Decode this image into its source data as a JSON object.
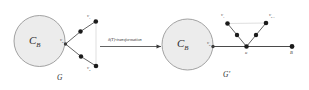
{
  "figure": {
    "left_graph": {
      "caption": "G",
      "cluster_label": "C",
      "cluster_sub": "B",
      "center_vertex": "v",
      "center_vertex_sub": "0",
      "nodes": [
        {
          "label": "v",
          "sub": "1"
        },
        {
          "label": "v",
          "sub": "2"
        }
      ]
    },
    "right_graph": {
      "caption": "G'",
      "cluster_label": "C",
      "cluster_sub": "B",
      "center_vertex": "v",
      "center_vertex_sub": "0",
      "apex_label": "u",
      "end_label": "B",
      "nodes": [
        {
          "label": "v",
          "sub": "1"
        },
        {
          "label": "v",
          "sub": "k-1"
        }
      ]
    },
    "arrow": {
      "label_prefix": "δ",
      "label_arg": "(T)",
      "label_suffix": "-transformation"
    },
    "colors": {
      "circle_fill": "#ececec",
      "circle_stroke": "#8c8c8c",
      "node_fill": "#1b1b1b",
      "edge": "#4a4a4a",
      "thin_edge": "#bdbdbd"
    }
  }
}
